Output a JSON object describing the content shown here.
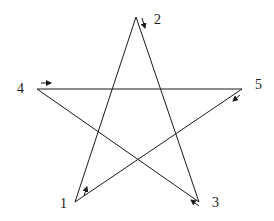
{
  "diagram": {
    "type": "pentagram",
    "stroke_color": "#1a1a1a",
    "vertices": [
      {
        "id": "1",
        "label": "1",
        "x": 75,
        "y": 202,
        "label_x": 60,
        "label_y": 208
      },
      {
        "id": "2",
        "label": "2",
        "x": 136,
        "y": 17,
        "label_x": 154,
        "label_y": 24
      },
      {
        "id": "3",
        "label": "3",
        "x": 199,
        "y": 202,
        "label_x": 212,
        "label_y": 207
      },
      {
        "id": "4",
        "label": "4",
        "x": 37,
        "y": 89,
        "label_x": 17,
        "label_y": 93
      },
      {
        "id": "5",
        "label": "5",
        "x": 242,
        "y": 89,
        "label_x": 255,
        "label_y": 89
      }
    ],
    "edges": [
      [
        "1",
        "2"
      ],
      [
        "2",
        "3"
      ],
      [
        "3",
        "4"
      ],
      [
        "4",
        "5"
      ],
      [
        "5",
        "1"
      ]
    ],
    "arrows": [
      {
        "near": "1",
        "direction": "up-right",
        "x1": 84,
        "y1": 196,
        "x2": 87,
        "y2": 187
      },
      {
        "near": "2",
        "direction": "down",
        "x1": 142,
        "y1": 18,
        "x2": 145,
        "y2": 28
      },
      {
        "near": "3",
        "direction": "up-left",
        "x1": 199,
        "y1": 206,
        "x2": 191,
        "y2": 200
      },
      {
        "near": "4",
        "direction": "right",
        "x1": 41,
        "y1": 83,
        "x2": 51,
        "y2": 83
      },
      {
        "near": "5",
        "direction": "down-left",
        "x1": 240,
        "y1": 95,
        "x2": 233,
        "y2": 101
      }
    ]
  }
}
